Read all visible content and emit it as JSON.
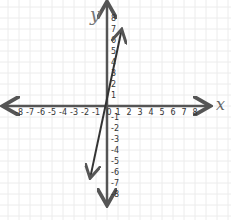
{
  "chart_data": {
    "type": "line",
    "title": "",
    "xlabel": "x",
    "ylabel": "y",
    "xlim": [
      -8,
      8
    ],
    "ylim": [
      -8,
      8
    ],
    "grid": true,
    "x_ticks": [
      "-8",
      "-7",
      "-6",
      "-5",
      "-4",
      "-3",
      "-2",
      "-1",
      "0",
      "1",
      "2",
      "3",
      "4",
      "5",
      "6",
      "7",
      "8"
    ],
    "y_ticks": [
      "8",
      "7",
      "6",
      "5",
      "4",
      "3",
      "2",
      "1",
      "-1",
      "-2",
      "-3",
      "-4",
      "-5",
      "-6",
      "-7",
      "-8"
    ],
    "series": [
      {
        "name": "line",
        "x": [
          -1.5,
          1.3
        ],
        "y": [
          -6.4,
          6.8
        ],
        "color": "#333333",
        "arrows": "both"
      }
    ]
  },
  "axes": {
    "x_label": "x",
    "y_label": "y",
    "color": "#555555",
    "grid_color": "#ececec"
  }
}
